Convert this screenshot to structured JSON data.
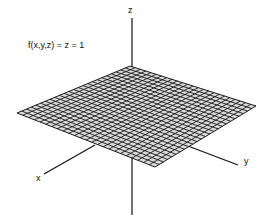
{
  "equation": "f(x,y,z) = z = 1",
  "axes": {
    "x": "x",
    "y": "y",
    "z": "z"
  },
  "plane": {
    "corners": {
      "left": [
        17,
        113
      ],
      "top": [
        130,
        66
      ],
      "right": [
        256,
        106
      ],
      "bottom": [
        155,
        167
      ]
    },
    "grid_divisions": 24,
    "line_color": "#1a1a1a",
    "fill_color": "#d9d9d9"
  }
}
